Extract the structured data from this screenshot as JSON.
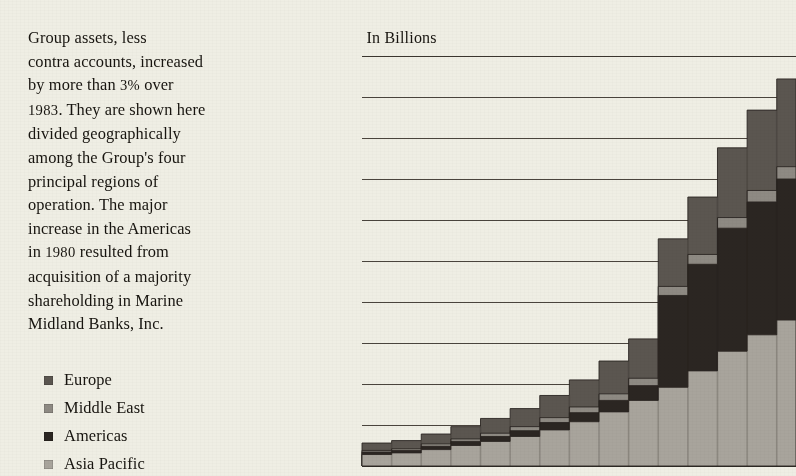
{
  "article": {
    "paragraph": "Group assets, less contra accounts, increased by more than 3% over 1983. They are shown here divided geographically among the Group's four principal regions of operation. The major increase in the Americas in 1980 resulted from acquisition of a majority shareholding in Marine Midland Banks, Inc.",
    "line1": "Group assets, less",
    "line2": "contra accounts, increased",
    "line3a": "by more than ",
    "line3b": "3%",
    "line3c": " over",
    "line4a": "1983",
    "line4b": ". They are shown here",
    "line5": "divided geographically",
    "line6": "among the Group's four",
    "line7": "principal regions of",
    "line8": "operation. The major",
    "line9": "increase in the Americas",
    "line10a": "in ",
    "line10b": "1980",
    "line10c": " resulted from",
    "line11": "acquisition of a majority",
    "line12": "shareholding in Marine",
    "line13": "Midland Banks, Inc."
  },
  "legend": {
    "items": [
      {
        "label": "Europe",
        "color": "#5b5650"
      },
      {
        "label": "Middle East",
        "color": "#8e8a83"
      },
      {
        "label": "Americas",
        "color": "#2b2622"
      },
      {
        "label": "Asia Pacific",
        "color": "#a8a49c"
      }
    ]
  },
  "chart": {
    "title_prefix": "HK",
    "title_currency": "$",
    "title_value": "500",
    "title_suffix": " In Billions",
    "background": "#efeee4",
    "gridline_color": "#4a443c"
  },
  "chart_data": {
    "type": "area",
    "title": "HK$500 In Billions",
    "xlabel": "",
    "ylabel": "HK$ In Billions",
    "ylim": [
      0,
      500
    ],
    "yticks": [
      0,
      50,
      100,
      150,
      200,
      250,
      300,
      350,
      400,
      450,
      500
    ],
    "ytick_labels": [
      "0",
      "50",
      "100",
      "150",
      "200",
      "250",
      "300",
      "350",
      "400",
      "450",
      "500"
    ],
    "grid": true,
    "stacked": true,
    "step": true,
    "legend_position": "left-outside",
    "x": [
      1970,
      1971,
      1972,
      1973,
      1974,
      1975,
      1976,
      1977,
      1978,
      1979,
      1980,
      1981,
      1982,
      1983,
      1984
    ],
    "series": [
      {
        "name": "Asia Pacific",
        "color": "#a8a49c",
        "values": [
          14,
          16,
          20,
          25,
          30,
          36,
          44,
          54,
          66,
          80,
          96,
          116,
          140,
          160,
          178
        ]
      },
      {
        "name": "Americas",
        "color": "#2b2622",
        "values": [
          3,
          3,
          4,
          5,
          6,
          7,
          9,
          11,
          14,
          18,
          112,
          130,
          150,
          162,
          172
        ]
      },
      {
        "name": "Middle East",
        "color": "#8e8a83",
        "values": [
          2,
          2,
          3,
          3,
          4,
          5,
          6,
          7,
          8,
          9,
          11,
          12,
          13,
          14,
          15
        ]
      },
      {
        "name": "Europe",
        "color": "#5b5650",
        "values": [
          9,
          10,
          12,
          15,
          18,
          22,
          27,
          33,
          40,
          48,
          58,
          70,
          85,
          98,
          107
        ]
      }
    ],
    "totals": [
      28,
      31,
      39,
      48,
      58,
      70,
      86,
      105,
      128,
      155,
      277,
      328,
      388,
      434,
      472
    ],
    "annotation": "Major increase in the Americas in 1980 from acquisition of a majority shareholding in Marine Midland Banks, Inc."
  }
}
